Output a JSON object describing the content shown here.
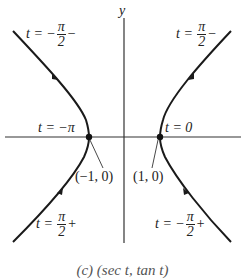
{
  "axes": {
    "y_label": "y"
  },
  "labels": {
    "top_left": {
      "prefix": "t = −",
      "num": "π",
      "den": "2",
      "suffix": "−"
    },
    "top_right": {
      "prefix": "t = ",
      "num": "π",
      "den": "2",
      "suffix": "−"
    },
    "bottom_left": {
      "prefix": "t = ",
      "num": "π",
      "den": "2",
      "suffix": "+"
    },
    "bottom_right": {
      "prefix": "t = −",
      "num": "π",
      "den": "2",
      "suffix": "+"
    },
    "left_vertex_param": "t = −π",
    "right_vertex_param": "t = 0",
    "left_vertex_point": "(−1, 0)",
    "right_vertex_point": "(1, 0)"
  },
  "caption": "(c)    (sec t, tan t)",
  "colors": {
    "curve": "#1a1a1a",
    "axis": "#333333"
  }
}
